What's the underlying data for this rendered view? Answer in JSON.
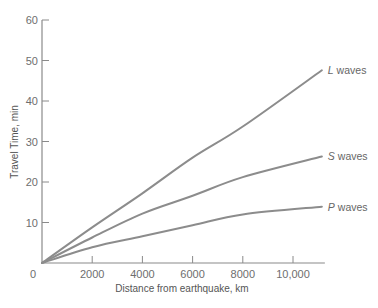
{
  "chart_data": {
    "type": "line",
    "title": "",
    "xlabel": "Distance from earthquake, km",
    "ylabel": "Travel Time, min",
    "xlim": [
      0,
      11150
    ],
    "ylim": [
      0,
      60
    ],
    "grid": false,
    "legend_position": "inline-right",
    "x_ticks": [
      0,
      2000,
      4000,
      6000,
      8000,
      10000
    ],
    "x_tick_labels": [
      "0",
      "2000",
      "4000",
      "6000",
      "8000",
      "10,000"
    ],
    "y_ticks": [
      0,
      10,
      20,
      30,
      40,
      50,
      60
    ],
    "y_tick_labels": [
      "0",
      "10",
      "20",
      "30",
      "40",
      "50",
      "60"
    ],
    "x": [
      0,
      2000,
      4000,
      6000,
      8000,
      11150
    ],
    "series": [
      {
        "name": "L waves",
        "letter": "L",
        "suffix": " waves",
        "values": [
          0,
          8.8,
          17.2,
          26.0,
          33.7,
          47.6
        ]
      },
      {
        "name": "S waves",
        "letter": "S",
        "suffix": " waves",
        "values": [
          0,
          6.3,
          12.2,
          16.6,
          21.2,
          26.3
        ]
      },
      {
        "name": "P waves",
        "letter": "P",
        "suffix": " waves",
        "values": [
          0,
          3.9,
          6.6,
          9.3,
          12.0,
          13.9
        ]
      }
    ]
  },
  "style": {
    "axis_color": "#8a8a8a",
    "line_color": "#8c8c8c",
    "text_color": "#666666"
  }
}
